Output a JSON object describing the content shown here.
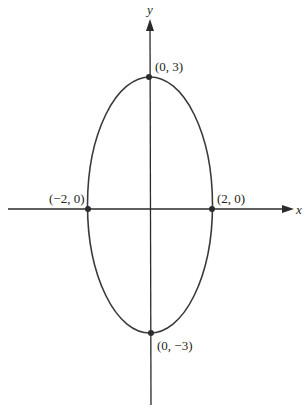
{
  "figure": {
    "type": "ellipse",
    "equation_params": {
      "a": 2,
      "b": 3,
      "center": [
        0,
        0
      ]
    },
    "colors": {
      "stroke": "#2b2b2b",
      "background": "#ffffff"
    }
  },
  "axes": {
    "x_label": "x",
    "y_label": "y"
  },
  "points": [
    {
      "id": "top",
      "label": "(0, 3)",
      "coords": [
        0,
        3
      ]
    },
    {
      "id": "left",
      "label": "(−2, 0)",
      "coords": [
        -2,
        0
      ]
    },
    {
      "id": "right",
      "label": "(2, 0)",
      "coords": [
        2,
        0
      ]
    },
    {
      "id": "bottom",
      "label": "(0, −3)",
      "coords": [
        0,
        -3
      ]
    }
  ]
}
